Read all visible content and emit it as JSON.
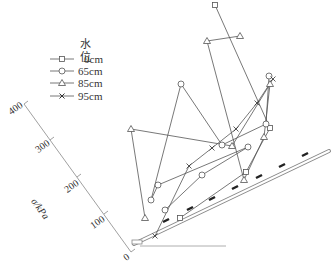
{
  "chart_data": {
    "type": "line",
    "title": "",
    "legend": {
      "title": "水位",
      "position": "upper-left",
      "entries": [
        {
          "label": "0cm",
          "marker": "square"
        },
        {
          "label": "65cm",
          "marker": "circle"
        },
        {
          "label": "85cm",
          "marker": "triangle"
        },
        {
          "label": "95cm",
          "marker": "x"
        }
      ]
    },
    "ylabel": "σ/kPa",
    "yticks": [
      "0",
      "100",
      "200",
      "300",
      "400"
    ],
    "ylim": [
      0,
      400
    ],
    "grid": false,
    "note": "Oblique plot: stress values plotted normal to an inclined slope surface (hatched baseline).",
    "series": [
      {
        "name": "0cm",
        "marker": "square",
        "pixel_points": [
          [
            215,
            5
          ],
          [
            270,
            128
          ],
          [
            246,
            172
          ],
          [
            180,
            218
          ]
        ]
      },
      {
        "name": "65cm",
        "marker": "circle",
        "pixel_points": [
          [
            269,
            76
          ],
          [
            266,
            124
          ],
          [
            222,
            145
          ],
          [
            181,
            84
          ],
          [
            151,
            200
          ],
          [
            158,
            185
          ],
          [
            248,
            147
          ],
          [
            202,
            175
          ],
          [
            165,
            210
          ]
        ]
      },
      {
        "name": "85cm",
        "marker": "triangle",
        "pixel_points": [
          [
            240,
            36
          ],
          [
            207,
            41
          ],
          [
            244,
            180
          ],
          [
            264,
            137
          ],
          [
            270,
            84
          ],
          [
            232,
            146
          ],
          [
            131,
            129
          ],
          [
            145,
            218
          ]
        ]
      },
      {
        "name": "95cm",
        "marker": "x",
        "pixel_points": [
          [
            155,
            236
          ],
          [
            189,
            166
          ],
          [
            212,
            148
          ],
          [
            236,
            129
          ],
          [
            257,
            103
          ],
          [
            273,
            79
          ]
        ]
      }
    ]
  },
  "legend": {
    "title": "水位",
    "items": [
      "0cm",
      "65cm",
      "85cm",
      "95cm"
    ]
  },
  "axis": {
    "label": "σ/kPa",
    "ticks": [
      "400",
      "300",
      "200",
      "100",
      "0"
    ]
  }
}
